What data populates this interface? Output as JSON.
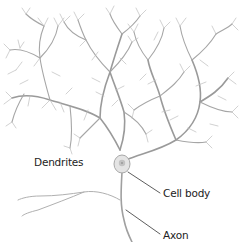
{
  "diagram": {
    "labels": {
      "dendrites": "Dendrites",
      "cell_body": "Cell body",
      "axon": "Axon"
    },
    "colors": {
      "background": "#ffffff",
      "dendrite_stroke": "#9a9a9a",
      "dendrite_fine": "#b8b8b8",
      "cell_body_fill": "#e4e4e4",
      "cell_body_stroke": "#a8a8a8",
      "nucleus": "#c2c2c2",
      "leader_line": "#333333",
      "label_text": "#222222"
    }
  }
}
